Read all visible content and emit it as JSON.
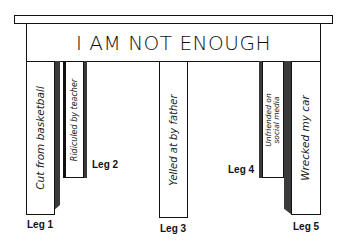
{
  "diagram": {
    "title": "I AM NOT ENOUGH",
    "legs": [
      {
        "id": "leg-1",
        "label": "Leg 1",
        "text": "Cut from basketball"
      },
      {
        "id": "leg-2",
        "label": "Leg 2",
        "text": "Ridiculed by teacher"
      },
      {
        "id": "leg-3",
        "label": "Leg 3",
        "text": "Yelled at by father"
      },
      {
        "id": "leg-4",
        "label": "Leg 4",
        "text_line1": "Unfriended on",
        "text_line2": "social media"
      },
      {
        "id": "leg-5",
        "label": "Leg 5",
        "text": "Wrecked my car"
      }
    ],
    "colors": {
      "outline": "#111111",
      "shadow": "#3a3a3a",
      "fill": "#ffffff"
    }
  }
}
